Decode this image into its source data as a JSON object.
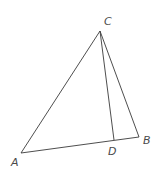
{
  "diagram": {
    "type": "triangle",
    "points": {
      "A": {
        "x": 21,
        "y": 153
      },
      "B": {
        "x": 139,
        "y": 137
      },
      "C": {
        "x": 100,
        "y": 31
      },
      "D": {
        "x": 114,
        "y": 140
      }
    },
    "labels": {
      "A": "A",
      "B": "B",
      "C": "C",
      "D": "D"
    },
    "segments": [
      "AB",
      "BC",
      "CA",
      "CD"
    ],
    "colors": {
      "line": "#3a3a3a",
      "label": "#4a4a4a",
      "background": "#ffffff"
    }
  }
}
